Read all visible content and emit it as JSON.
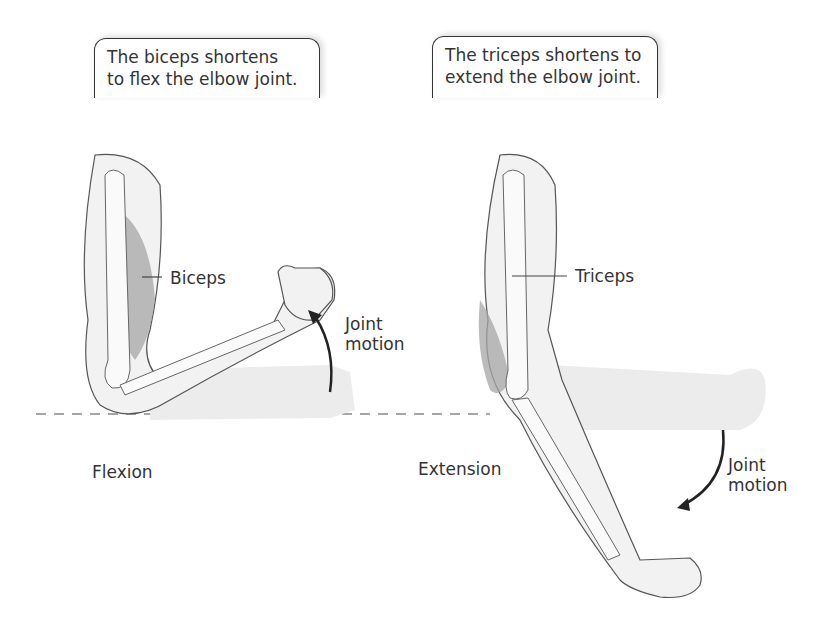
{
  "callouts": {
    "flexion": {
      "line1": "The biceps shortens",
      "line2": "to flex the elbow joint."
    },
    "extension": {
      "line1": "The triceps shortens to",
      "line2": "extend the elbow joint."
    }
  },
  "labels": {
    "biceps": "Biceps",
    "triceps": "Triceps",
    "joint_motion_left": {
      "line1": "Joint",
      "line2": "motion"
    },
    "joint_motion_right": {
      "line1": "Joint",
      "line2": "motion"
    },
    "flexion": "Flexion",
    "extension": "Extension"
  },
  "colors": {
    "outline": "#555555",
    "skin": "#ececec",
    "muscle": "#9a9a9a",
    "ghost": "#eeeeee",
    "arrow": "#222222",
    "dashed": "#888888"
  }
}
